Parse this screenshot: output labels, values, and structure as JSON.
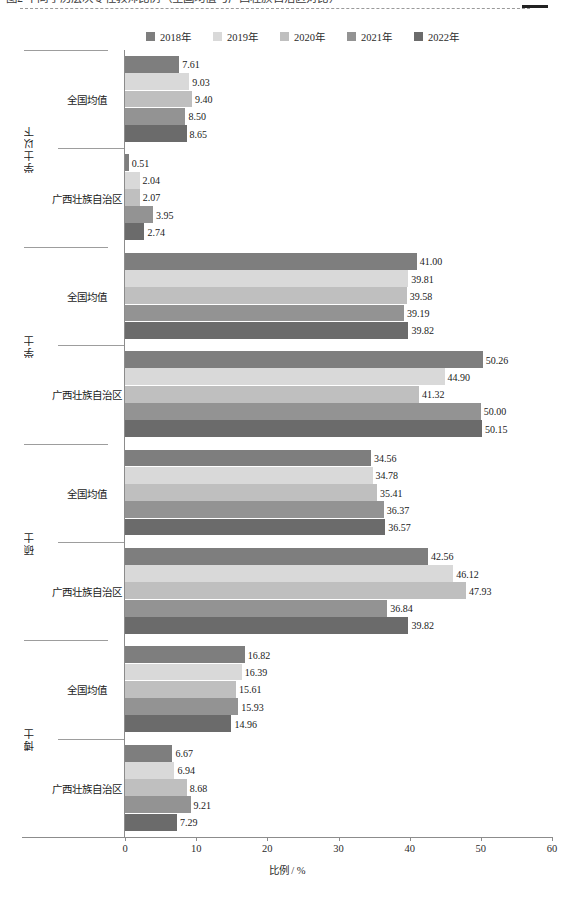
{
  "top_caption": {
    "text": "图2  不同学历层次专任教师比例（全国均值与广西壮族自治区对比）",
    "truncated": true
  },
  "legend": {
    "position": "top",
    "items": [
      {
        "label": "2018年",
        "color": "#7e7e7e"
      },
      {
        "label": "2019年",
        "color": "#d9d9d9"
      },
      {
        "label": "2020年",
        "color": "#bfbfbf"
      },
      {
        "label": "2021年",
        "color": "#939393"
      },
      {
        "label": "2022年",
        "color": "#6b6b6b"
      }
    ]
  },
  "axes": {
    "xlabel": "比例 / %",
    "xticks": [
      0,
      10,
      20,
      30,
      40,
      50,
      60
    ],
    "xlim": [
      0,
      60
    ],
    "ylabel_groups": [
      "学士以下",
      "学士",
      "硕士",
      "博士"
    ],
    "ycategories": [
      "全国均值",
      "广西壮族自治区"
    ]
  },
  "chart_data": {
    "type": "bar",
    "orientation": "horizontal",
    "title": "",
    "xlabel": "比例 / %",
    "ylabel": "",
    "xlim": [
      0,
      60
    ],
    "xticks": [
      0,
      10,
      20,
      30,
      40,
      50,
      60
    ],
    "grid": false,
    "legend_position": "top",
    "series": [
      {
        "name": "2018年",
        "color": "#7e7e7e"
      },
      {
        "name": "2019年",
        "color": "#d9d9d9"
      },
      {
        "name": "2020年",
        "color": "#bfbfbf"
      },
      {
        "name": "2021年",
        "color": "#939393"
      },
      {
        "name": "2022年",
        "color": "#6b6b6b"
      }
    ],
    "groups": [
      {
        "level": "学士以下",
        "categories": [
          {
            "name": "全国均值",
            "values": [
              7.61,
              9.03,
              9.4,
              8.5,
              8.65
            ],
            "labels": [
              "7.61",
              "9.03",
              "9.40",
              "8.50",
              "8.65"
            ]
          },
          {
            "name": "广西壮族自治区",
            "values": [
              0.51,
              2.04,
              2.07,
              3.95,
              2.74
            ],
            "labels": [
              "0.51",
              "2.04",
              "2.07",
              "3.95",
              "2.74"
            ]
          }
        ]
      },
      {
        "level": "学士",
        "categories": [
          {
            "name": "全国均值",
            "values": [
              41.0,
              39.81,
              39.58,
              39.19,
              39.82
            ],
            "labels": [
              "41.00",
              "39.81",
              "39.58",
              "39.19",
              "39.82"
            ]
          },
          {
            "name": "广西壮族自治区",
            "values": [
              50.26,
              44.9,
              41.32,
              50.0,
              50.15
            ],
            "labels": [
              "50.26",
              "44.90",
              "41.32",
              "50.00",
              "50.15"
            ]
          }
        ]
      },
      {
        "level": "硕士",
        "categories": [
          {
            "name": "全国均值",
            "values": [
              34.56,
              34.78,
              35.41,
              36.37,
              36.57
            ],
            "labels": [
              "34.56",
              "34.78",
              "35.41",
              "36.37",
              "36.57"
            ]
          },
          {
            "name": "广西壮族自治区",
            "values": [
              42.56,
              46.12,
              47.93,
              36.84,
              39.82
            ],
            "labels": [
              "42.56",
              "46.12",
              "47.93",
              "36.84",
              "39.82"
            ]
          }
        ]
      },
      {
        "level": "博士",
        "categories": [
          {
            "name": "全国均值",
            "values": [
              16.82,
              16.39,
              15.61,
              15.93,
              14.96
            ],
            "labels": [
              "16.82",
              "16.39",
              "15.61",
              "15.93",
              "14.96"
            ]
          },
          {
            "name": "广西壮族自治区",
            "values": [
              6.67,
              6.94,
              8.68,
              9.21,
              7.29
            ],
            "labels": [
              "6.67",
              "6.94",
              "8.68",
              "9.21",
              "7.29"
            ]
          }
        ]
      }
    ]
  }
}
